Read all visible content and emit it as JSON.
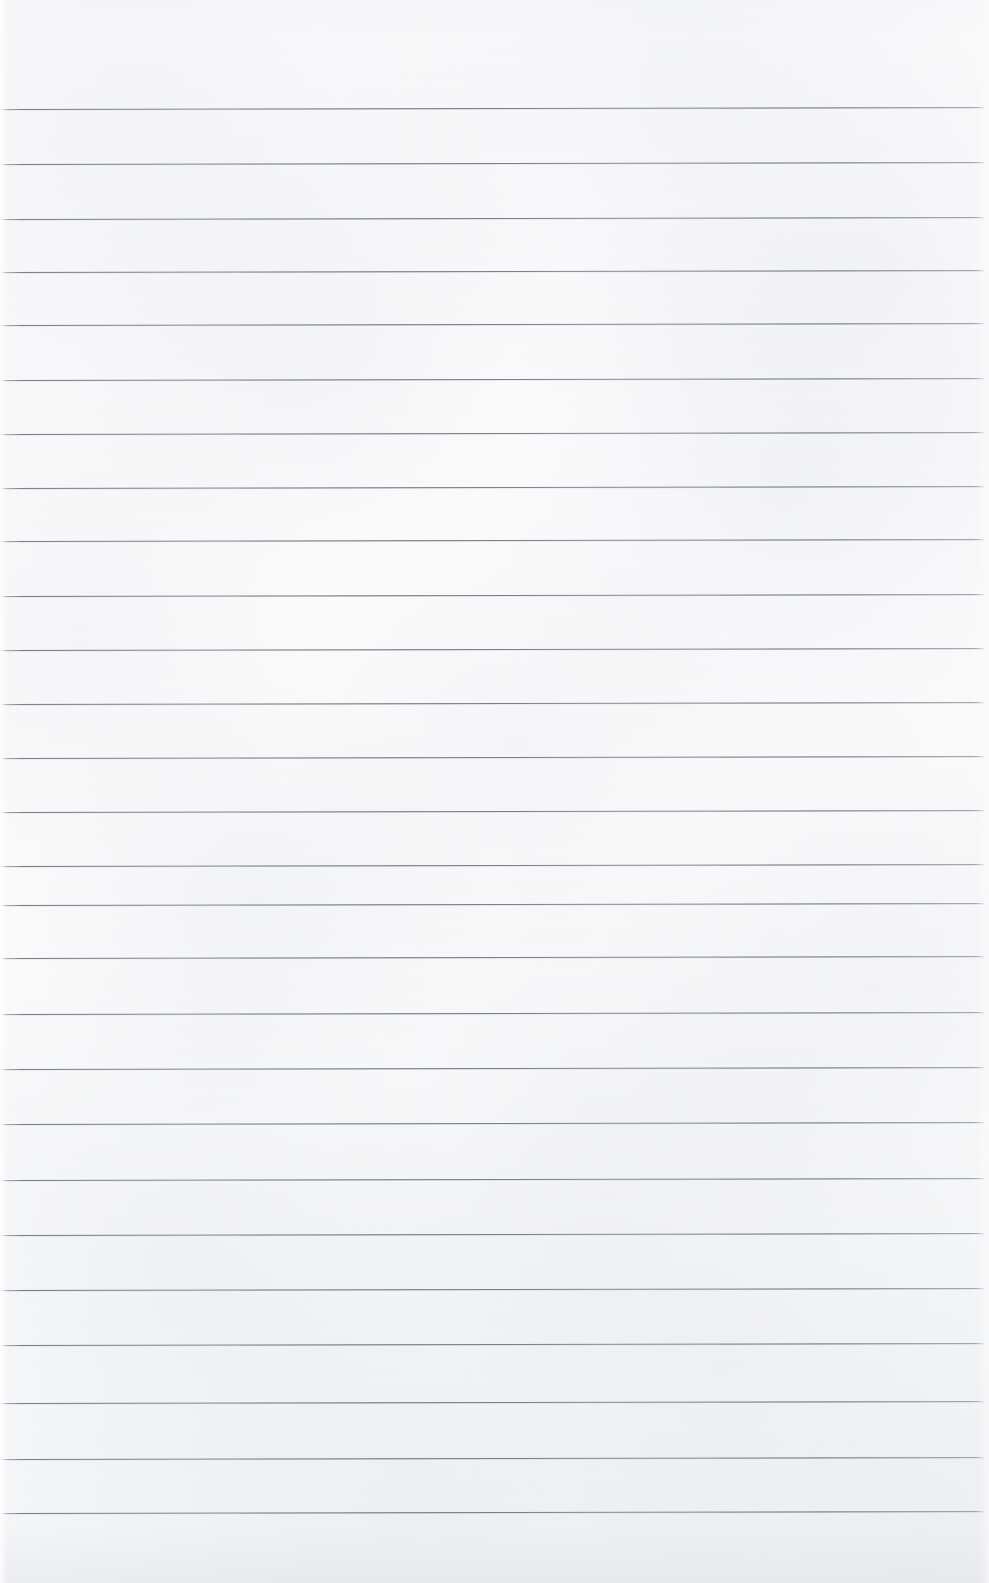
{
  "document": {
    "kind": "scanned-lined-notebook-page",
    "page_width": 989,
    "page_height": 1583,
    "content_text": "",
    "written_content_present": false,
    "paper_color": "#fbfbfc",
    "background_tint_bottom": "#f4f5f7",
    "rule_color": "#6c747f",
    "rule_thickness_px": 1,
    "header_blank_height_px": 109,
    "footer_blank_height_px": 70,
    "left_margin_px": 4,
    "right_margin_px": 5,
    "rule_line_count": 27,
    "average_rule_spacing_px": 54
  },
  "rules": {
    "x_start": 4,
    "x_end": 984,
    "skew_deg": -0.12,
    "y_positions": [
      109,
      164,
      219,
      272,
      325,
      380,
      434,
      488,
      541,
      596,
      650,
      704,
      758,
      812,
      866,
      905,
      958,
      1014,
      1069,
      1124,
      1180,
      1235,
      1290,
      1345,
      1403,
      1459,
      1513
    ]
  },
  "accessibility": {
    "alt_text": "Blank ruled notebook paper, scanned. Horizontal gray lines across a white sheet with no writing.",
    "page_label": "",
    "line_label_prefix": "ruled-line"
  }
}
